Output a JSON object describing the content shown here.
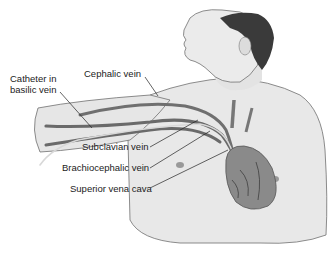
{
  "diagram": {
    "labels": {
      "catheter": [
        "Catheter in",
        "basilic vein"
      ],
      "cephalic": "Cephalic vein",
      "subclavian": "Subclavian vein",
      "brachiocephalic": "Brachiocephalic vein",
      "svc": "Superior vena cava"
    },
    "colors": {
      "skin": "#e6e6e6",
      "outline": "#6a6a6a",
      "hair": "#3a3a3a",
      "vein": "#7a7a7a",
      "vein_dark": "#555555",
      "heart": "#8a8a8a",
      "catheter": "#d8d8d8",
      "leader": "#222222"
    }
  }
}
